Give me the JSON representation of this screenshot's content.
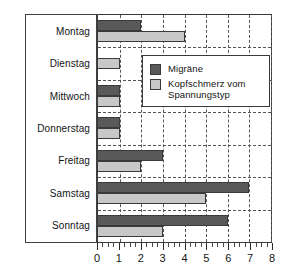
{
  "chart_data": {
    "type": "bar",
    "orientation": "horizontal",
    "title": "",
    "xlabel": "",
    "ylabel": "",
    "xlim": [
      0,
      8
    ],
    "xticks": [
      0,
      1,
      2,
      3,
      4,
      5,
      6,
      7,
      8
    ],
    "xtick_labels": [
      "0",
      "1",
      "2",
      "3",
      "4",
      "5",
      "6",
      "7",
      "8"
    ],
    "minor_ticks_per_interval": 4,
    "grid": "vertical dashed gridlines at each integer; horizontal dashed separators between day groups",
    "legend_position": "upper center inside plot",
    "categories": [
      "Montag",
      "Dienstag",
      "Mittwoch",
      "Donnerstag",
      "Freitag",
      "Samstag",
      "Sonntag"
    ],
    "series": [
      {
        "name": "Migräne",
        "color": "#595959",
        "values": [
          2,
          0,
          1,
          1,
          3,
          7,
          6
        ]
      },
      {
        "name": "Kopfschmerz vom Spannungstyp",
        "color": "#c8c8c8",
        "values": [
          4,
          1,
          1,
          1,
          2,
          5,
          3
        ]
      }
    ]
  },
  "legend": {
    "items": [
      {
        "label": "Migräne",
        "label_line2": "",
        "color": "#595959",
        "swatch_name": "legend-swatch-migraene"
      },
      {
        "label": "Kopfschmerz vom",
        "label_line2": "Spannungstyp",
        "color": "#c8c8c8",
        "swatch_name": "legend-swatch-spannungstyp"
      }
    ]
  },
  "axis": {
    "tick_labels": [
      "0",
      "1",
      "2",
      "3",
      "4",
      "5",
      "6",
      "7",
      "8"
    ]
  },
  "categories": {
    "labels": [
      "Montag",
      "Dienstag",
      "Mittwoch",
      "Donnerstag",
      "Freitag",
      "Samstag",
      "Sonntag"
    ]
  },
  "colors": {
    "dark": "#595959",
    "light": "#c8c8c8",
    "outline": "#3a3a3a",
    "grid": "#555555",
    "background": "#ffffff"
  }
}
